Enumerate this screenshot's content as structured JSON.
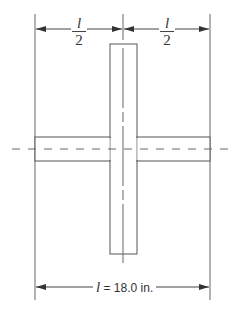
{
  "figure": {
    "top_dimension_left": {
      "numerator": "l",
      "denominator": "2"
    },
    "top_dimension_right": {
      "numerator": "l",
      "denominator": "2"
    },
    "bottom_dimension": {
      "symbol": "l",
      "text": " = 18.0 in."
    },
    "line_color": "#555555"
  }
}
